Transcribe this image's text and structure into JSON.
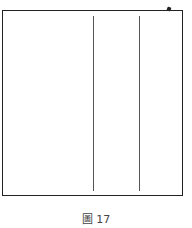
{
  "figure": {
    "caption_char": "圖",
    "caption_number": "17",
    "lines": [
      {
        "x": 93,
        "y1": 16,
        "y2": 191
      },
      {
        "x": 139,
        "y1": 16,
        "y2": 191
      }
    ]
  }
}
